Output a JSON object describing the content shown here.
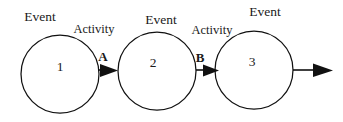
{
  "diagram": {
    "type": "network-diagram",
    "colors": {
      "background": "#ffffff",
      "stroke": "#111111",
      "text": "#1a1a1a"
    },
    "nodes": [
      {
        "id": "node-1",
        "number": "1",
        "label": "Event",
        "cx": 60,
        "cy": 74,
        "r": 39
      },
      {
        "id": "node-2",
        "number": "2",
        "label": "Event",
        "cx": 157,
        "cy": 71,
        "r": 39
      },
      {
        "id": "node-3",
        "number": "3",
        "label": "Event",
        "cx": 254,
        "cy": 70,
        "r": 39
      }
    ],
    "connectors": [
      {
        "id": "connector-a",
        "label": "Activity",
        "activity_id": "A",
        "from": "node-1",
        "to": "node-2"
      },
      {
        "id": "connector-b",
        "label": "Activity",
        "activity_id": "B",
        "from": "node-2",
        "to": "node-3"
      },
      {
        "id": "connector-out",
        "label": "",
        "activity_id": "",
        "from": "node-3",
        "to": ""
      }
    ]
  }
}
